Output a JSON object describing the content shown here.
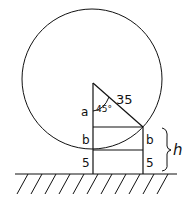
{
  "diagram": {
    "labels": {
      "hypotenuse": "35",
      "angle": "45°",
      "vertical_a": "a",
      "left_b": "b",
      "right_b": "b",
      "left_5": "5",
      "right_5": "5",
      "height": "h"
    },
    "colors": {
      "stroke": "#111111",
      "background": "#ffffff"
    }
  }
}
